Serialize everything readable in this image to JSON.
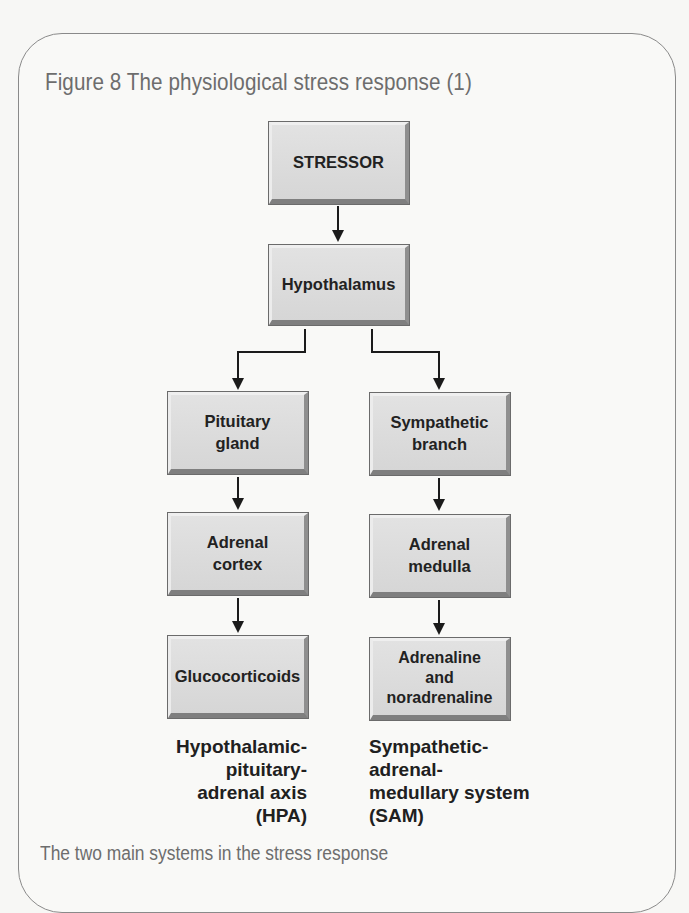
{
  "figure": {
    "title": "Figure 8  The physiological stress response (1)",
    "caption": "The two main systems in the stress response"
  },
  "diagram": {
    "nodes": {
      "stressor": "STRESSOR",
      "hypothalamus": "Hypothalamus",
      "pituitary": "Pituitary\ngland",
      "sympathetic": "Sympathetic\nbranch",
      "adrenal_cortex": "Adrenal\ncortex",
      "adrenal_medulla": "Adrenal\nmedulla",
      "glucocorticoids": "Glucocorticoids",
      "adrenaline": "Adrenaline\nand\nnoradrenaline"
    },
    "edges": [
      [
        "stressor",
        "hypothalamus"
      ],
      [
        "hypothalamus",
        "pituitary"
      ],
      [
        "hypothalamus",
        "sympathetic"
      ],
      [
        "pituitary",
        "adrenal_cortex"
      ],
      [
        "adrenal_cortex",
        "glucocorticoids"
      ],
      [
        "sympathetic",
        "adrenal_medulla"
      ],
      [
        "adrenal_medulla",
        "adrenaline"
      ]
    ],
    "systems": {
      "hpa": "Hypothalamic-\npituitary-\nadrenal axis\n(HPA)",
      "sam": "Sympathetic-\nadrenal-\nmedullary system\n(SAM)"
    }
  }
}
